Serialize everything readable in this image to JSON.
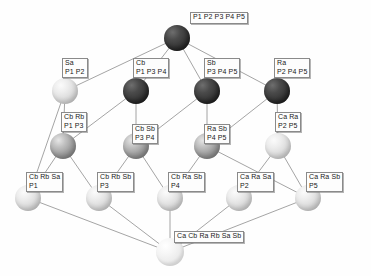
{
  "diagram": {
    "nodes": [
      {
        "id": "top",
        "x": 177,
        "y": 38,
        "r": 13,
        "shade": "dark",
        "label_lines": [
          "P1 P2 P3 P4 P5"
        ],
        "label_x": 190,
        "label_y": 12
      },
      {
        "id": "sa",
        "x": 65,
        "y": 91,
        "r": 13,
        "shade": "light",
        "label_lines": [
          "Sa",
          "P1 P2"
        ],
        "label_x": 62,
        "label_y": 58
      },
      {
        "id": "cb",
        "x": 136,
        "y": 91,
        "r": 13,
        "shade": "dark",
        "label_lines": [
          "Cb",
          "P1 P3 P4"
        ],
        "label_x": 133,
        "label_y": 58
      },
      {
        "id": "sb",
        "x": 207,
        "y": 91,
        "r": 13,
        "shade": "dark",
        "label_lines": [
          "Sb",
          "P3 P4 P5"
        ],
        "label_x": 204,
        "label_y": 58
      },
      {
        "id": "ra",
        "x": 277,
        "y": 91,
        "r": 13,
        "shade": "dark",
        "label_lines": [
          "Ra",
          "P2 P4 P5"
        ],
        "label_x": 274,
        "label_y": 58
      },
      {
        "id": "cbrb",
        "x": 63,
        "y": 146,
        "r": 13,
        "shade": "mid",
        "label_lines": [
          "Cb Rb",
          "P1 P3"
        ],
        "label_x": 61,
        "label_y": 112
      },
      {
        "id": "cbsb",
        "x": 136,
        "y": 146,
        "r": 13,
        "shade": "mid",
        "label_lines": [
          "Cb Sb",
          "P3 P4"
        ],
        "label_x": 132,
        "label_y": 124
      },
      {
        "id": "rasb",
        "x": 207,
        "y": 146,
        "r": 13,
        "shade": "mid",
        "label_lines": [
          "Ra Sb",
          "P4 P5"
        ],
        "label_x": 204,
        "label_y": 124
      },
      {
        "id": "cara",
        "x": 278,
        "y": 146,
        "r": 13,
        "shade": "light",
        "label_lines": [
          "Ca Ra",
          "P2 P5"
        ],
        "label_x": 275,
        "label_y": 112
      },
      {
        "id": "cbrbsa",
        "x": 28,
        "y": 198,
        "r": 13,
        "shade": "light",
        "label_lines": [
          "Cb Rb Sa",
          "P1"
        ],
        "label_x": 26,
        "label_y": 172
      },
      {
        "id": "cbrbsb",
        "x": 99,
        "y": 198,
        "r": 13,
        "shade": "light",
        "label_lines": [
          "Cb Rb Sb",
          "P3"
        ],
        "label_x": 97,
        "label_y": 172
      },
      {
        "id": "cbrasb",
        "x": 170,
        "y": 198,
        "r": 13,
        "shade": "light",
        "label_lines": [
          "Cb Ra Sb",
          "P4"
        ],
        "label_x": 168,
        "label_y": 172
      },
      {
        "id": "carasa",
        "x": 239,
        "y": 198,
        "r": 13,
        "shade": "light",
        "label_lines": [
          "Ca Ra Sa",
          "P2"
        ],
        "label_x": 237,
        "label_y": 172
      },
      {
        "id": "carasb",
        "x": 308,
        "y": 198,
        "r": 13,
        "shade": "light",
        "label_lines": [
          "Ca Ra Sb",
          "P5"
        ],
        "label_x": 306,
        "label_y": 172
      },
      {
        "id": "bottom",
        "x": 170,
        "y": 252,
        "r": 14,
        "shade": "pale",
        "label_lines": [
          "Ca Cb Ra Rb Sa Sb"
        ],
        "label_x": 174,
        "label_y": 231
      }
    ],
    "edges": [
      [
        "top",
        "sa"
      ],
      [
        "top",
        "cb"
      ],
      [
        "top",
        "sb"
      ],
      [
        "top",
        "ra"
      ],
      [
        "sa",
        "cbrb"
      ],
      [
        "cb",
        "cbrb"
      ],
      [
        "cb",
        "cbsb"
      ],
      [
        "sb",
        "cbsb"
      ],
      [
        "sb",
        "rasb"
      ],
      [
        "ra",
        "rasb"
      ],
      [
        "ra",
        "cara"
      ],
      [
        "sa",
        "cbrbsa"
      ],
      [
        "cbrb",
        "cbrbsa"
      ],
      [
        "cbrb",
        "cbrbsb"
      ],
      [
        "cbsb",
        "cbrbsb"
      ],
      [
        "cbsb",
        "cbrasb"
      ],
      [
        "rasb",
        "cbrasb"
      ],
      [
        "rasb",
        "carasb"
      ],
      [
        "cara",
        "carasa"
      ],
      [
        "cara",
        "carasb"
      ],
      [
        "cbrbsa",
        "bottom"
      ],
      [
        "cbrbsb",
        "bottom"
      ],
      [
        "cbrasb",
        "bottom"
      ],
      [
        "carasa",
        "bottom"
      ],
      [
        "carasb",
        "bottom"
      ]
    ],
    "edge_color": "#9a9a9a"
  }
}
